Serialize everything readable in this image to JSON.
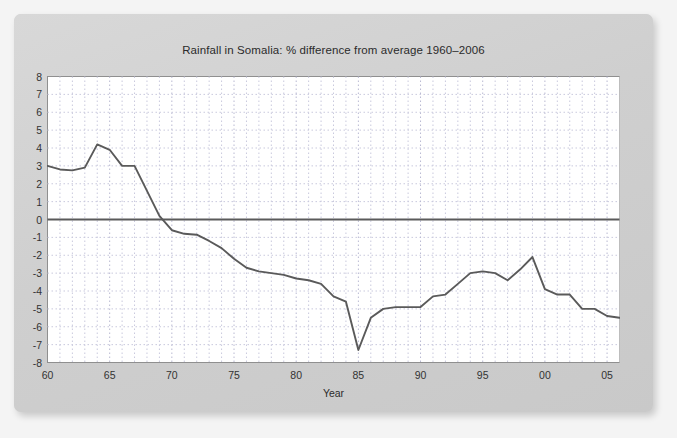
{
  "chart_data": {
    "type": "line",
    "title": "Rainfall in Somalia: % difference from average 1960–2006",
    "xlabel": "Year",
    "ylabel": "",
    "xlim": [
      1960,
      2006
    ],
    "ylim": [
      -8,
      8
    ],
    "grid": true,
    "legend": null,
    "y_ticks": [
      8,
      7,
      6,
      5,
      4,
      3,
      2,
      1,
      0,
      -1,
      -2,
      -3,
      -4,
      -5,
      -6,
      -7,
      -8
    ],
    "y_tick_labels": [
      "8",
      "7",
      "6",
      "5",
      "4",
      "3",
      "2",
      "1",
      "0",
      "-1",
      "-2",
      "-3",
      "-4",
      "-5",
      "-6",
      "-7",
      "-8"
    ],
    "x_ticks": [
      1960,
      1965,
      1970,
      1975,
      1980,
      1985,
      1990,
      1995,
      2000,
      2005
    ],
    "x_tick_labels": [
      "60",
      "65",
      "70",
      "75",
      "80",
      "85",
      "90",
      "95",
      "00",
      "05"
    ],
    "series": [
      {
        "name": "Rainfall % difference from average",
        "color": "#5a5a5a",
        "x": [
          1960,
          1961,
          1962,
          1963,
          1964,
          1965,
          1966,
          1967,
          1968,
          1969,
          1970,
          1971,
          1972,
          1973,
          1974,
          1975,
          1976,
          1977,
          1978,
          1979,
          1980,
          1981,
          1982,
          1983,
          1984,
          1985,
          1986,
          1987,
          1988,
          1989,
          1990,
          1991,
          1992,
          1993,
          1994,
          1995,
          1996,
          1997,
          1998,
          1999,
          2000,
          2001,
          2002,
          2003,
          2004,
          2005,
          2006
        ],
        "values": [
          3.0,
          2.8,
          2.75,
          2.9,
          4.2,
          3.9,
          3.0,
          3.0,
          1.6,
          0.2,
          -0.6,
          -0.8,
          -0.85,
          -1.2,
          -1.6,
          -2.2,
          -2.7,
          -2.9,
          -3.0,
          -3.1,
          -3.3,
          -3.4,
          -3.6,
          -4.3,
          -4.6,
          -7.3,
          -5.5,
          -5.0,
          -4.9,
          -4.9,
          -4.9,
          -4.3,
          -4.2,
          -3.6,
          -3.0,
          -2.9,
          -3.0,
          -3.4,
          -2.8,
          -2.1,
          -3.9,
          -4.2,
          -4.2,
          -5.0,
          -5.0,
          -5.4,
          -5.5
        ]
      }
    ],
    "zero_line": {
      "value": 0,
      "color": "#5a5a5a"
    }
  },
  "style": {
    "page_background": "#f4f4f4",
    "card_background": "#d2d2d2",
    "plot_background": "#ffffff",
    "grid_color": "#c9c9dd",
    "axis_color": "#8f8f8f",
    "line_color": "#5a5a5a",
    "text_color": "#2b2b2b"
  }
}
